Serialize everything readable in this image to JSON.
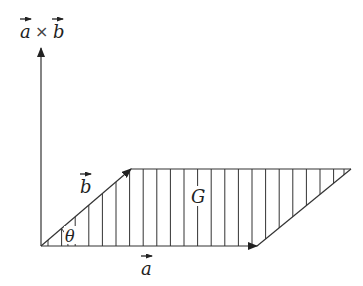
{
  "diagram": {
    "labels": {
      "cross_a": "a",
      "cross_times": "×",
      "cross_b": "b",
      "vec_a": "a",
      "vec_b": "b",
      "angle": "θ",
      "area": "G"
    },
    "colors": {
      "stroke": "#333333",
      "background": "#ffffff"
    },
    "geometry": {
      "origin": [
        41,
        246
      ],
      "a_tip": [
        257,
        246
      ],
      "b_tip": [
        131,
        169
      ],
      "far_vertex": [
        351,
        169
      ],
      "axis_top": [
        41,
        48
      ],
      "hatch_spacing": 13.6
    }
  }
}
